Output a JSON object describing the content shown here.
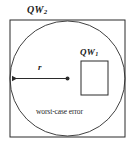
{
  "figure": {
    "title": "",
    "background_color": "#ffffff",
    "stroke_color": "#2b2b2b",
    "text_color": "#1a1a1a",
    "labels": {
      "outer_square": {
        "base": "QW",
        "subscript": "2"
      },
      "inner_square": {
        "base": "QW",
        "subscript": "1"
      },
      "radius": "r",
      "caption": "worst-case error"
    },
    "shapes": {
      "outer_square": {
        "name": "outer-square",
        "x": 10,
        "y": 20,
        "width": 115,
        "height": 117
      },
      "circle": {
        "name": "inscribed-circle",
        "cx": 67.5,
        "cy": 78.5,
        "r": 57.5
      },
      "inner_square": {
        "name": "inner-square",
        "x": 81,
        "y": 61,
        "width": 27,
        "height": 34
      },
      "radius_arrow": {
        "name": "radius-arrow",
        "x1": 10,
        "y1": 78.5,
        "x2": 67.5,
        "y2": 78.5,
        "arrow_at": "start"
      },
      "center_dot": {
        "name": "center-dot",
        "cx": 67.5,
        "cy": 78.5,
        "r": 2
      }
    }
  }
}
